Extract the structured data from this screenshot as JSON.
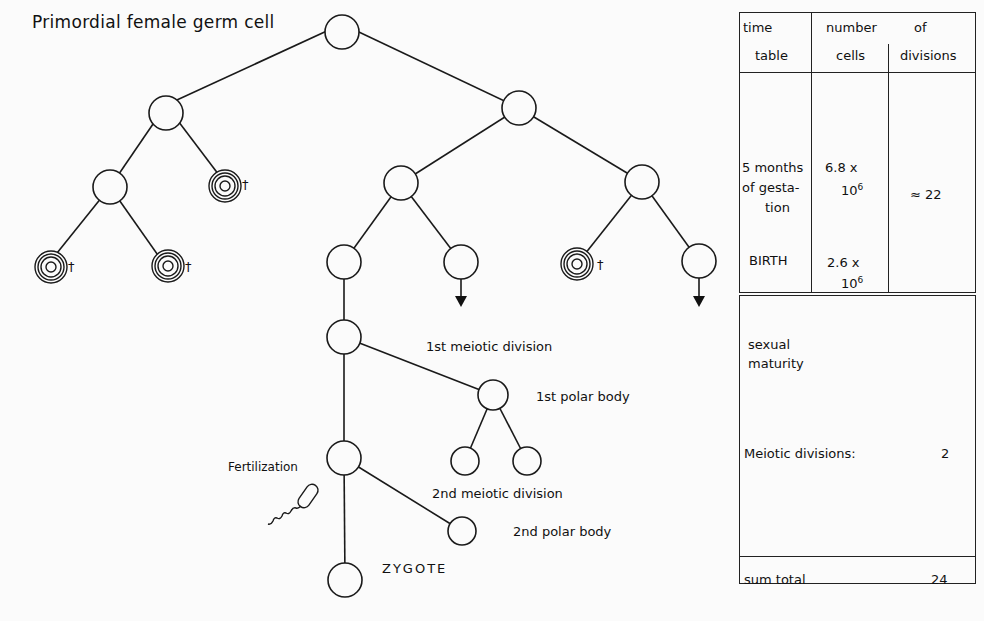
{
  "diagram": {
    "title": "Primordial female germ cell",
    "dagger": "†",
    "labels": {
      "first_meiotic": "1st meiotic division",
      "first_polar": "1st polar body",
      "fertilization": "Fertilization",
      "second_meiotic": "2nd meiotic division",
      "second_polar": "2nd polar body",
      "zygote": "ZYGOTE"
    },
    "line_color": "#1a1a1a",
    "background": "#fbfbfb"
  },
  "table": {
    "headers": {
      "time_line1": "time",
      "time_line2": "table",
      "number": "number",
      "of": "of",
      "cells": "cells",
      "divisions": "divisions"
    },
    "rows": [
      {
        "time": "5 months of gesta-tion",
        "time_l1": "5 months",
        "time_l2": "of gesta-",
        "time_l3": "tion",
        "cells_base": "6.8 x",
        "cells_exp_base": "10",
        "cells_exp": "6",
        "divisions": "≈ 22"
      },
      {
        "time": "BIRTH",
        "time_l1": "BIRTH",
        "cells_base": "2.6 x",
        "cells_exp_base": "10",
        "cells_exp": "6",
        "divisions": ""
      }
    ],
    "maturity": {
      "line1": "sexual",
      "line2": "maturity",
      "meiotic_label": "Meiotic divisions:",
      "meiotic_value": "2"
    },
    "total": {
      "label": "sum total",
      "value": "24"
    }
  }
}
